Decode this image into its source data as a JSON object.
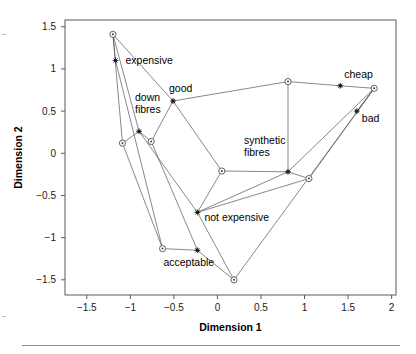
{
  "chart_data": {
    "type": "scatter",
    "title": "",
    "xlabel": "Dimension 1",
    "ylabel": "Dimension 2",
    "xlim": [
      -1.75,
      2.05
    ],
    "ylim": [
      -1.68,
      1.58
    ],
    "xticks": [
      -1.5,
      -1,
      -0.5,
      0,
      0.5,
      1,
      1.5,
      2
    ],
    "xtick_labels": [
      "−1.5",
      "−1",
      "−0.5",
      "0",
      "0.5",
      "1",
      "1.5",
      "2"
    ],
    "yticks": [
      -1.5,
      -1,
      -0.5,
      0,
      0.5,
      1,
      1.5
    ],
    "ytick_labels": [
      "−1.5",
      "−1",
      "−0.5",
      "0",
      "0.5",
      "1",
      "1.5"
    ],
    "grid": false,
    "legend": "none",
    "series": [
      {
        "name": "objects",
        "marker": "circle-dot",
        "points": [
          {
            "x": -1.2,
            "y": 1.41,
            "label": ""
          },
          {
            "x": -1.09,
            "y": 0.12,
            "label": ""
          },
          {
            "x": -0.76,
            "y": 0.14,
            "label": ""
          },
          {
            "x": -0.63,
            "y": -1.13,
            "label": ""
          },
          {
            "x": 0.05,
            "y": -0.21,
            "label": ""
          },
          {
            "x": 0.19,
            "y": -1.5,
            "label": ""
          },
          {
            "x": 0.81,
            "y": 0.85,
            "label": ""
          },
          {
            "x": 1.05,
            "y": -0.3,
            "label": ""
          },
          {
            "x": 1.8,
            "y": 0.77,
            "label": ""
          }
        ]
      },
      {
        "name": "attributes",
        "marker": "star",
        "points": [
          {
            "x": -1.17,
            "y": 1.1,
            "label": "expensive",
            "lx": 10,
            "ly": 4
          },
          {
            "x": -0.9,
            "y": 0.26,
            "label": "down\nfibres",
            "lx": -4,
            "ly": -30
          },
          {
            "x": -0.51,
            "y": 0.62,
            "label": "good",
            "lx": -4,
            "ly": -9
          },
          {
            "x": -0.23,
            "y": -0.7,
            "label": "not expensive",
            "lx": 7,
            "ly": 9
          },
          {
            "x": -0.23,
            "y": -1.15,
            "label": "acceptable",
            "lx": -34,
            "ly": 16
          },
          {
            "x": 0.81,
            "y": -0.22,
            "label": "synthetic\nfibres",
            "lx": -44,
            "ly": -28
          },
          {
            "x": 1.41,
            "y": 0.8,
            "label": "cheap",
            "lx": 4,
            "ly": -8
          },
          {
            "x": 1.6,
            "y": 0.5,
            "label": "bad",
            "lx": 5,
            "ly": 11
          }
        ]
      }
    ],
    "segments": [
      [
        [
          -1.2,
          1.41
        ],
        [
          -1.09,
          0.12
        ]
      ],
      [
        [
          -1.2,
          1.41
        ],
        [
          -1.17,
          1.1
        ]
      ],
      [
        [
          -1.2,
          1.41
        ],
        [
          -0.9,
          0.26
        ]
      ],
      [
        [
          -1.2,
          1.41
        ],
        [
          -0.51,
          0.62
        ]
      ],
      [
        [
          -1.17,
          1.1
        ],
        [
          -0.63,
          -1.13
        ]
      ],
      [
        [
          -1.09,
          0.12
        ],
        [
          -0.9,
          0.26
        ]
      ],
      [
        [
          -1.09,
          0.12
        ],
        [
          -0.63,
          -1.13
        ]
      ],
      [
        [
          -0.9,
          0.26
        ],
        [
          -0.76,
          0.14
        ]
      ],
      [
        [
          -0.9,
          0.26
        ],
        [
          -0.23,
          -0.7
        ]
      ],
      [
        [
          -0.76,
          0.14
        ],
        [
          -0.51,
          0.62
        ]
      ],
      [
        [
          -0.76,
          0.14
        ],
        [
          -0.23,
          -1.15
        ]
      ],
      [
        [
          -0.51,
          0.62
        ],
        [
          0.05,
          -0.21
        ]
      ],
      [
        [
          -0.51,
          0.62
        ],
        [
          0.81,
          0.85
        ]
      ],
      [
        [
          -0.63,
          -1.13
        ],
        [
          -0.23,
          -1.15
        ]
      ],
      [
        [
          -0.23,
          -1.15
        ],
        [
          0.19,
          -1.5
        ]
      ],
      [
        [
          -0.23,
          -0.7
        ],
        [
          0.05,
          -0.21
        ]
      ],
      [
        [
          -0.23,
          -0.7
        ],
        [
          0.19,
          -1.5
        ]
      ],
      [
        [
          -0.23,
          -0.7
        ],
        [
          1.05,
          -0.3
        ]
      ],
      [
        [
          -0.23,
          -0.7
        ],
        [
          0.81,
          -0.22
        ]
      ],
      [
        [
          0.05,
          -0.21
        ],
        [
          0.81,
          -0.22
        ]
      ],
      [
        [
          0.19,
          -1.5
        ],
        [
          1.8,
          0.77
        ]
      ],
      [
        [
          0.81,
          0.85
        ],
        [
          0.81,
          -0.22
        ]
      ],
      [
        [
          0.81,
          0.85
        ],
        [
          1.41,
          0.8
        ]
      ],
      [
        [
          0.81,
          -0.22
        ],
        [
          1.05,
          -0.3
        ]
      ],
      [
        [
          0.81,
          -0.22
        ],
        [
          1.8,
          0.77
        ]
      ],
      [
        [
          1.05,
          -0.3
        ],
        [
          1.8,
          0.77
        ]
      ],
      [
        [
          1.41,
          0.8
        ],
        [
          1.8,
          0.77
        ]
      ],
      [
        [
          1.6,
          0.5
        ],
        [
          1.8,
          0.77
        ]
      ]
    ]
  }
}
